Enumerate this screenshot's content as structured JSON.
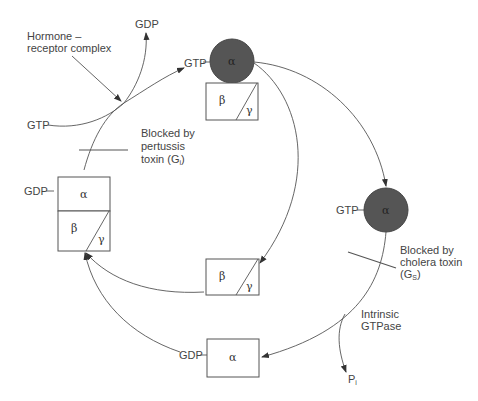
{
  "diagram": {
    "colors": {
      "line": "#555555",
      "active_alpha_fill": "#555555",
      "text": "#444444",
      "background": "#ffffff"
    },
    "labels": {
      "hormone_line1": "Hormone –",
      "hormone_line2": "receptor complex",
      "gdp_top": "GDP",
      "gtp_left": "GTP",
      "gtp_top_circle": "GTP",
      "gtp_right_circle": "GTP",
      "gdp_left_box": "GDP",
      "gdp_bottom_box": "GDP",
      "pertussis_line1": "Blocked by",
      "pertussis_line2": "pertussis",
      "pertussis_line3_prefix": "toxin (G",
      "pertussis_subscript": "i",
      "pertussis_suffix": ")",
      "cholera_line1": "Blocked by",
      "cholera_line2": "cholera toxin",
      "cholera_line3_prefix": "(G",
      "cholera_subscript": "S",
      "cholera_suffix": ")",
      "gtpase_line1": "Intrinsic",
      "gtpase_line2": "GTPase",
      "pi_main": "P",
      "pi_subscript": "i"
    },
    "subunits": {
      "alpha": "α",
      "beta": "β",
      "gamma": "γ"
    },
    "nodes": [
      {
        "id": "inactive-heterotrimer",
        "description": "GDP-bound α with βγ",
        "parts": [
          "α",
          "β",
          "γ"
        ]
      },
      {
        "id": "active-alpha-top",
        "description": "GTP-bound α dissociating from βγ",
        "parts": [
          "α",
          "β",
          "γ"
        ]
      },
      {
        "id": "active-alpha-right",
        "description": "GTP-bound free α",
        "parts": [
          "α"
        ]
      },
      {
        "id": "free-beta-gamma",
        "description": "free βγ dimer",
        "parts": [
          "β",
          "γ"
        ]
      },
      {
        "id": "inactive-alpha-bottom",
        "description": "GDP-bound free α",
        "parts": [
          "α"
        ]
      }
    ]
  }
}
